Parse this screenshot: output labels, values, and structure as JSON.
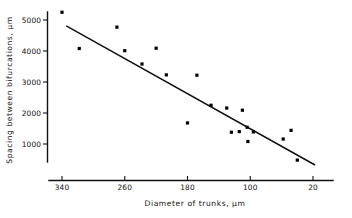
{
  "chart_data": {
    "type": "scatter",
    "title": "",
    "xlabel": "Diameter of trunks, µm",
    "ylabel": "Spacing between bifurcations, µm",
    "xlim": [
      360,
      8
    ],
    "ylim": [
      250,
      5450
    ],
    "x_reversed": true,
    "grid": false,
    "legend": "none",
    "xticks": [
      340,
      260,
      180,
      100,
      20
    ],
    "xtick_labels": [
      "340",
      "260",
      "180",
      "100",
      "20"
    ],
    "yticks": [
      1000,
      2000,
      3000,
      4000,
      5000
    ],
    "ytick_labels": [
      "1000",
      "2000",
      "3000",
      "4000",
      "5000"
    ],
    "points": [
      {
        "x": 340,
        "y": 5250
      },
      {
        "x": 318,
        "y": 4080
      },
      {
        "x": 270,
        "y": 4770
      },
      {
        "x": 260,
        "y": 4010
      },
      {
        "x": 238,
        "y": 3580
      },
      {
        "x": 220,
        "y": 4090
      },
      {
        "x": 207,
        "y": 3230
      },
      {
        "x": 180,
        "y": 1680
      },
      {
        "x": 168,
        "y": 3220
      },
      {
        "x": 150,
        "y": 2250
      },
      {
        "x": 130,
        "y": 2160
      },
      {
        "x": 124,
        "y": 1380
      },
      {
        "x": 114,
        "y": 1400
      },
      {
        "x": 110,
        "y": 2090
      },
      {
        "x": 104,
        "y": 1540
      },
      {
        "x": 103,
        "y": 1080
      },
      {
        "x": 96,
        "y": 1390
      },
      {
        "x": 58,
        "y": 1160
      },
      {
        "x": 48,
        "y": 1440
      },
      {
        "x": 40,
        "y": 480
      }
    ],
    "trend_line": {
      "x_start": 334,
      "y_start": 4800,
      "x_end": 18,
      "y_end": 330,
      "style": "solid",
      "color": "#111111"
    }
  },
  "axes": {
    "y_axis_label": "Spacing between bifurcations, µm",
    "x_axis_label": "Diameter of trunks, µm"
  }
}
